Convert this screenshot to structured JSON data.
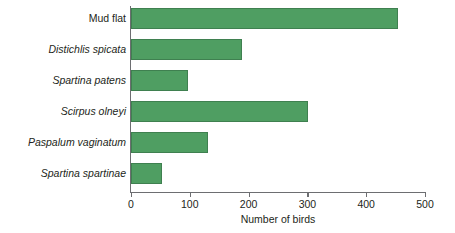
{
  "chart_data": {
    "type": "bar",
    "orientation": "horizontal",
    "title": "",
    "subtitle": "",
    "xlabel": "Number of birds",
    "ylabel": "",
    "categories": [
      "Mud flat",
      "Distichlis spicata",
      "Spartina patens",
      "Scirpus olneyi",
      "Paspalum vaginatum",
      "Spartina spartinae"
    ],
    "category_styles": [
      "normal",
      "italic",
      "italic",
      "italic",
      "italic",
      "italic"
    ],
    "values": [
      454,
      189,
      97,
      301,
      131,
      53
    ],
    "xlim": [
      0,
      500
    ],
    "xticks": [
      0,
      100,
      200,
      300,
      400,
      500
    ],
    "xtick_labels": [
      "0",
      "100",
      "200",
      "300",
      "400",
      "500"
    ],
    "grid": false,
    "legend": null,
    "bar_color": "#4f9e62",
    "bar_edge_color": "#3f8050",
    "axis_color": "#6d6e71",
    "text_color": "#231f20",
    "background": "#ffffff",
    "annotations": []
  }
}
